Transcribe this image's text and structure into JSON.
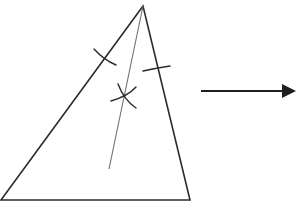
{
  "diagram": {
    "colors": {
      "background": "#ffffff",
      "triangle_stroke": "#2b2b2b",
      "bisector_stroke": "#707070",
      "arc_stroke": "#2b2b2b",
      "arrow_stroke": "#1e1e1e"
    },
    "triangle": {
      "vertices": [
        [
          143,
          6
        ],
        [
          1,
          200
        ],
        [
          190,
          200
        ]
      ]
    },
    "bisector": {
      "from": [
        143,
        6
      ],
      "to": [
        109,
        169
      ]
    },
    "arcs": [
      {
        "name": "arc-on-left-side",
        "path": "M94 49 Q104 60 116 65"
      },
      {
        "name": "arc-on-right-side",
        "path": "M143 71 Q157 68 170 66"
      },
      {
        "name": "intersection-arc-1",
        "path": "M118 84 Q124 100 136 108"
      },
      {
        "name": "intersection-arc-2",
        "path": "M111 101 Q128 96 136 87"
      }
    ],
    "arrow": {
      "from": [
        201,
        91
      ],
      "to": [
        295,
        91
      ],
      "direction": "right"
    }
  }
}
